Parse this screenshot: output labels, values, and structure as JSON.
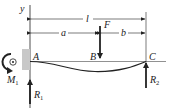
{
  "diagram": {
    "type": "beam-diagram",
    "axis_label": "y",
    "dimensions": {
      "total": "l",
      "left_segment": "a",
      "right_segment": "b"
    },
    "points": {
      "support_left": "A",
      "load_point": "B",
      "support_right": "C"
    },
    "loads": {
      "force": "F"
    },
    "reactions": {
      "moment": {
        "symbol": "M",
        "subscript": "1"
      },
      "left": {
        "symbol": "R",
        "subscript": "1"
      },
      "right": {
        "symbol": "R",
        "subscript": "2"
      }
    },
    "colors": {
      "line": "#222222",
      "wall": "#c8c8c8"
    }
  }
}
